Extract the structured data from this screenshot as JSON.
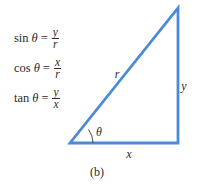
{
  "figure": {
    "caption": "(b)",
    "line_color": "#4a8ad6",
    "vertices": {
      "origin": [
        70,
        143
      ],
      "right_angle": [
        178,
        143
      ],
      "top": [
        178,
        8
      ]
    },
    "labels": {
      "hypotenuse": "r",
      "opposite": "y",
      "adjacent": "x",
      "angle": "θ"
    }
  },
  "formulas": [
    {
      "fn": "sin",
      "var": "θ",
      "eq": "=",
      "numerator": "y",
      "denominator": "r"
    },
    {
      "fn": "cos",
      "var": "θ",
      "eq": "=",
      "numerator": "x",
      "denominator": "r"
    },
    {
      "fn": "tan",
      "var": "θ",
      "eq": "=",
      "numerator": "y",
      "denominator": "x"
    }
  ]
}
